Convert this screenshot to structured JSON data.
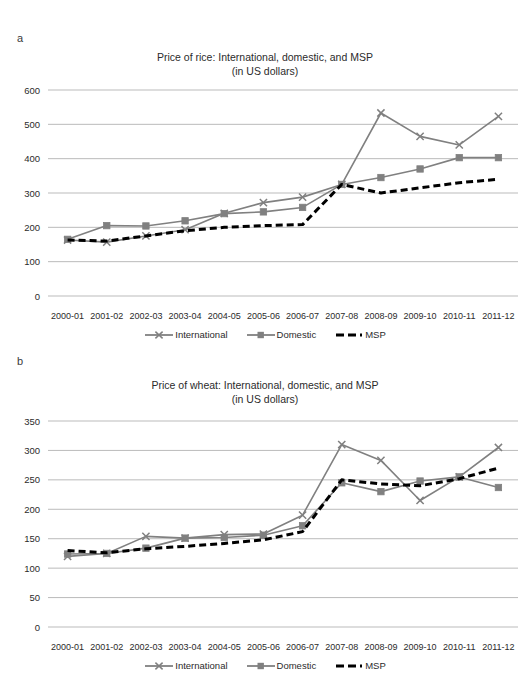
{
  "figure": {
    "panels": [
      {
        "letter": "a",
        "title_line1": "Price of rice: International, domestic, and MSP",
        "title_line2": "(in US dollars)"
      },
      {
        "letter": "b",
        "title_line1": "Price of wheat: International, domestic, and MSP",
        "title_line2": "(in US dollars)"
      }
    ],
    "legend": [
      {
        "key": "line-cross-marker",
        "label": "International"
      },
      {
        "key": "line-square-marker",
        "label": "Domestic"
      },
      {
        "key": "dashed-line",
        "label": "MSP"
      }
    ],
    "colors": {
      "international": "#808080",
      "domestic": "#808080",
      "msp": "#000000",
      "gridline": "#b3b3b3",
      "text": "#2b2b2b"
    }
  },
  "chart_data": [
    {
      "type": "line",
      "panel": "a",
      "title": "Price of rice: International, domestic, and MSP (in US dollars)",
      "xlabel": "",
      "ylabel": "",
      "ylim": [
        0,
        600
      ],
      "yticks": [
        0,
        100,
        200,
        300,
        400,
        500,
        600
      ],
      "grid": true,
      "legend_position": "bottom",
      "categories": [
        "2000-01",
        "2001-02",
        "2002-03",
        "2003-04",
        "2004-05",
        "2005-06",
        "2006-07",
        "2007-08",
        "2008-09",
        "2009-10",
        "2010-11",
        "2011-12"
      ],
      "series": [
        {
          "name": "International",
          "marker": "x",
          "values": [
            163,
            157,
            175,
            193,
            241,
            272,
            288,
            325,
            533,
            465,
            440,
            523
          ]
        },
        {
          "name": "Domestic",
          "marker": "square",
          "values": [
            165,
            205,
            204,
            219,
            240,
            245,
            258,
            325,
            345,
            370,
            403,
            403
          ]
        },
        {
          "name": "MSP",
          "marker": "none",
          "values": [
            163,
            160,
            175,
            190,
            200,
            205,
            208,
            325,
            300,
            315,
            330,
            340
          ]
        }
      ]
    },
    {
      "type": "line",
      "panel": "b",
      "title": "Price of wheat: International, domestic, and MSP (in US dollars)",
      "xlabel": "",
      "ylabel": "",
      "ylim": [
        0,
        350
      ],
      "yticks": [
        0,
        50,
        100,
        150,
        200,
        250,
        300,
        350
      ],
      "grid": true,
      "legend_position": "bottom",
      "categories": [
        "2000-01",
        "2001-02",
        "2002-03",
        "2003-04",
        "2004-05",
        "2005-06",
        "2006-07",
        "2007-08",
        "2008-09",
        "2009-10",
        "2010-11",
        "2011-12"
      ],
      "series": [
        {
          "name": "International",
          "marker": "x",
          "values": [
            120,
            125,
            154,
            151,
            157,
            158,
            190,
            310,
            283,
            215,
            255,
            305
          ]
        },
        {
          "name": "Domestic",
          "marker": "square",
          "values": [
            124,
            125,
            134,
            151,
            152,
            156,
            172,
            245,
            230,
            248,
            255,
            237
          ]
        },
        {
          "name": "MSP",
          "marker": "none",
          "values": [
            130,
            126,
            133,
            137,
            142,
            148,
            162,
            250,
            243,
            240,
            252,
            270
          ]
        }
      ]
    }
  ]
}
